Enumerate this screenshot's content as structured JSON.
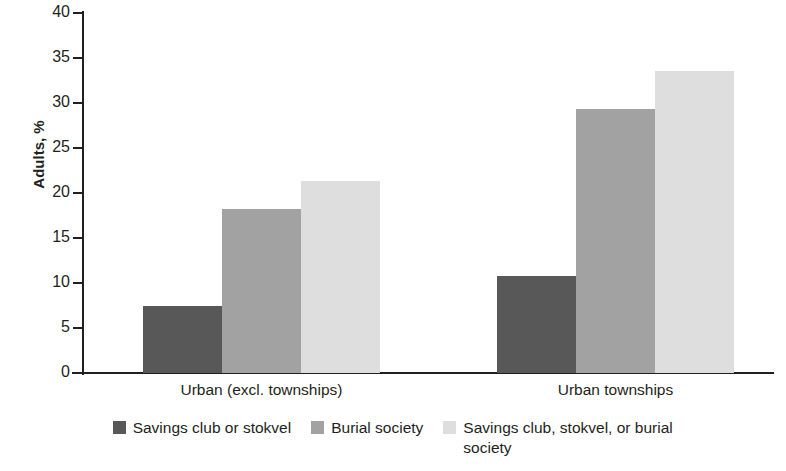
{
  "chart_data": {
    "type": "bar",
    "title": "",
    "subtitle": "",
    "xlabel": "",
    "ylabel": "Adults, %",
    "ylim": [
      0,
      40
    ],
    "ytick_step": 5,
    "yticks": [
      "0",
      "5",
      "10",
      "15",
      "20",
      "25",
      "30",
      "35",
      "40"
    ],
    "ytick_values": [
      0,
      5,
      10,
      15,
      20,
      25,
      30,
      35,
      40
    ],
    "grid": false,
    "legend_position": "bottom",
    "categories": [
      "Urban (excl. townships)",
      "Urban townships"
    ],
    "series": [
      {
        "name": "Savings club or stokvel",
        "color": "#585858",
        "values": [
          7.5,
          10.8
        ]
      },
      {
        "name": "Burial society",
        "color": "#a2a2a2",
        "values": [
          18.2,
          29.3
        ]
      },
      {
        "name": "Savings club, stokvel, or burial society",
        "color": "#dedede",
        "values": [
          21.3,
          33.6
        ]
      }
    ]
  },
  "axis": {
    "y_title": "Adults, %"
  },
  "legend": {
    "items": [
      {
        "label": "Savings club or stokvel",
        "color": "#585858"
      },
      {
        "label": "Burial society",
        "color": "#a2a2a2"
      },
      {
        "label": "Savings club, stokvel, or burial society",
        "color": "#dedede"
      }
    ]
  },
  "colors": {
    "axis": "#231f20",
    "text": "#231f20",
    "background": "#ffffff",
    "series_1": "#585858",
    "series_2": "#a2a2a2",
    "series_3": "#dedede"
  }
}
